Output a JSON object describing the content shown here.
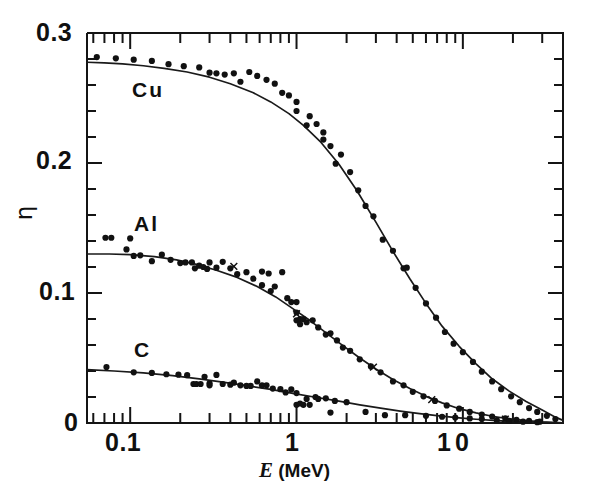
{
  "figure": {
    "axis_title_x_symbol": "E",
    "axis_title_x_units": " (MeV)",
    "axis_title_y": "η"
  },
  "labels": {
    "cu": "Cu",
    "al": "Al",
    "c": "C",
    "y_0_3": "0.3",
    "y_0_2": "0.2",
    "y_0_1": "0.1",
    "y_0": "0",
    "x_0_1": "0.1",
    "x_1": "1",
    "x_10": "10"
  },
  "chart_data": {
    "type": "scatter",
    "title": "",
    "xlabel": "E (MeV)",
    "ylabel": "η",
    "xscale": "log",
    "yscale": "linear",
    "xlim": [
      0.055,
      40
    ],
    "ylim": [
      0,
      0.3
    ],
    "xticks": [
      0.1,
      1,
      10
    ],
    "xtick_labels": [
      "0.1",
      "1",
      "10"
    ],
    "yticks": [
      0,
      0.1,
      0.2,
      0.3
    ],
    "ytick_labels": [
      "0",
      "0.1",
      "0.2",
      "0.3"
    ],
    "minor_ticks": true,
    "grid": false,
    "legend": "inline-labels",
    "series": [
      {
        "name": "Cu",
        "label_pos": {
          "x": 0.16,
          "y": 0.253
        },
        "marker": "filled-circle",
        "curve": [
          [
            0.055,
            0.2775
          ],
          [
            0.07,
            0.277
          ],
          [
            0.09,
            0.2762
          ],
          [
            0.12,
            0.2748
          ],
          [
            0.16,
            0.2728
          ],
          [
            0.22,
            0.27
          ],
          [
            0.3,
            0.266
          ],
          [
            0.4,
            0.261
          ],
          [
            0.55,
            0.254
          ],
          [
            0.7,
            0.247
          ],
          [
            0.9,
            0.238
          ],
          [
            1.1,
            0.229
          ],
          [
            1.4,
            0.216
          ],
          [
            1.8,
            0.199
          ],
          [
            2.3,
            0.179
          ],
          [
            3.0,
            0.1545
          ],
          [
            3.8,
            0.132
          ],
          [
            4.8,
            0.111
          ],
          [
            6.0,
            0.092
          ],
          [
            7.5,
            0.0745
          ],
          [
            9.5,
            0.059
          ],
          [
            12,
            0.0455
          ],
          [
            15,
            0.034
          ],
          [
            19,
            0.0245
          ],
          [
            24,
            0.0165
          ],
          [
            30,
            0.01
          ],
          [
            36,
            0.0045
          ],
          [
            40,
            0.002
          ]
        ],
        "points": [
          [
            0.063,
            0.2815
          ],
          [
            0.082,
            0.2805
          ],
          [
            0.105,
            0.2795
          ],
          [
            0.135,
            0.2785
          ],
          [
            0.17,
            0.276
          ],
          [
            0.21,
            0.2745
          ],
          [
            0.26,
            0.2735
          ],
          [
            0.3,
            0.2695
          ],
          [
            0.33,
            0.269
          ],
          [
            0.37,
            0.268
          ],
          [
            0.42,
            0.269
          ],
          [
            0.46,
            0.2625
          ],
          [
            0.52,
            0.27
          ],
          [
            0.58,
            0.267
          ],
          [
            0.66,
            0.264
          ],
          [
            0.74,
            0.261
          ],
          [
            0.82,
            0.254
          ],
          [
            0.9,
            0.252
          ],
          [
            1.0,
            0.247
          ],
          [
            1.0,
            0.24
          ],
          [
            1.15,
            0.229
          ],
          [
            1.2,
            0.236
          ],
          [
            1.32,
            0.23
          ],
          [
            1.45,
            0.2235
          ],
          [
            1.45,
            0.218
          ],
          [
            1.6,
            0.213
          ],
          [
            1.72,
            0.1995
          ],
          [
            1.85,
            0.2065
          ],
          [
            2.1,
            0.193
          ],
          [
            2.35,
            0.179
          ],
          [
            2.6,
            0.167
          ],
          [
            2.9,
            0.159
          ],
          [
            3.3,
            0.141
          ],
          [
            3.8,
            0.1325
          ],
          [
            4.4,
            0.119
          ],
          [
            4.6,
            0.1195
          ],
          [
            5.2,
            0.104
          ],
          [
            6.0,
            0.092
          ],
          [
            6.9,
            0.081
          ],
          [
            7.8,
            0.07
          ],
          [
            8.8,
            0.061
          ],
          [
            10,
            0.0545
          ],
          [
            11.5,
            0.047
          ],
          [
            13,
            0.0395
          ],
          [
            15,
            0.032
          ],
          [
            17,
            0.026
          ],
          [
            19.5,
            0.0205
          ],
          [
            22,
            0.016
          ],
          [
            25,
            0.0115
          ],
          [
            28,
            0.0085
          ],
          [
            32,
            0.0055
          ],
          [
            36,
            0.003
          ]
        ]
      },
      {
        "name": "Al",
        "label_pos": {
          "x": 0.165,
          "y": 0.158
        },
        "marker": "filled-circle",
        "extra_marker": "cross",
        "curve": [
          [
            0.055,
            0.13
          ],
          [
            0.075,
            0.13
          ],
          [
            0.1,
            0.1295
          ],
          [
            0.14,
            0.128
          ],
          [
            0.19,
            0.1255
          ],
          [
            0.25,
            0.122
          ],
          [
            0.33,
            0.1175
          ],
          [
            0.44,
            0.112
          ],
          [
            0.58,
            0.105
          ],
          [
            0.75,
            0.097
          ],
          [
            0.95,
            0.088
          ],
          [
            1.2,
            0.079
          ],
          [
            1.5,
            0.0695
          ],
          [
            1.9,
            0.0595
          ],
          [
            2.4,
            0.05
          ],
          [
            3.0,
            0.0415
          ],
          [
            3.8,
            0.0335
          ],
          [
            4.8,
            0.0265
          ],
          [
            6.0,
            0.0205
          ],
          [
            7.5,
            0.0155
          ],
          [
            9.5,
            0.011
          ],
          [
            12,
            0.0078
          ],
          [
            15,
            0.0052
          ],
          [
            19,
            0.0032
          ],
          [
            24,
            0.0018
          ],
          [
            30,
            0.0009
          ],
          [
            36,
            0.0004
          ],
          [
            40,
            0.0002
          ]
        ],
        "points": [
          [
            0.071,
            0.1425
          ],
          [
            0.077,
            0.1425
          ],
          [
            0.1,
            0.142
          ],
          [
            0.095,
            0.1335
          ],
          [
            0.105,
            0.1285
          ],
          [
            0.115,
            0.129
          ],
          [
            0.135,
            0.1245
          ],
          [
            0.155,
            0.1295
          ],
          [
            0.175,
            0.1255
          ],
          [
            0.2,
            0.123
          ],
          [
            0.215,
            0.1235
          ],
          [
            0.235,
            0.1235
          ],
          [
            0.245,
            0.119
          ],
          [
            0.26,
            0.121
          ],
          [
            0.275,
            0.12
          ],
          [
            0.29,
            0.1185
          ],
          [
            0.3,
            0.1235
          ],
          [
            0.33,
            0.1195
          ],
          [
            0.36,
            0.124
          ],
          [
            0.4,
            0.119
          ],
          [
            0.44,
            0.1145
          ],
          [
            0.5,
            0.116
          ],
          [
            0.55,
            0.111
          ],
          [
            0.62,
            0.1165
          ],
          [
            0.62,
            0.106
          ],
          [
            0.68,
            0.115
          ],
          [
            0.7,
            0.1015
          ],
          [
            0.74,
            0.105
          ],
          [
            0.82,
            0.116
          ],
          [
            0.88,
            0.096
          ],
          [
            0.93,
            0.093
          ],
          [
            1.0,
            0.093
          ],
          [
            1.0,
            0.085
          ],
          [
            1.0,
            0.079
          ],
          [
            1.05,
            0.08
          ],
          [
            1.05,
            0.076
          ],
          [
            1.1,
            0.08
          ],
          [
            1.15,
            0.0775
          ],
          [
            1.25,
            0.079
          ],
          [
            1.35,
            0.0735
          ],
          [
            1.5,
            0.068
          ],
          [
            1.6,
            0.069
          ],
          [
            1.75,
            0.0635
          ],
          [
            1.9,
            0.058
          ],
          [
            2.1,
            0.0555
          ],
          [
            2.4,
            0.049
          ],
          [
            2.8,
            0.0435
          ],
          [
            3.2,
            0.039
          ],
          [
            3.8,
            0.032
          ],
          [
            4.4,
            0.029
          ],
          [
            5.0,
            0.024
          ],
          [
            5.8,
            0.0205
          ],
          [
            6.8,
            0.017
          ],
          [
            8.0,
            0.0135
          ],
          [
            9.5,
            0.011
          ],
          [
            11,
            0.0085
          ],
          [
            13,
            0.0065
          ],
          [
            15,
            0.005
          ],
          [
            18,
            0.0035
          ],
          [
            21,
            0.0025
          ],
          [
            25,
            0.0016
          ],
          [
            29,
            0.001
          ]
        ],
        "cross_points": [
          [
            0.42,
            0.1205
          ],
          [
            1.0,
            0.084
          ],
          [
            2.9,
            0.043
          ],
          [
            6.5,
            0.018
          ],
          [
            18,
            0.003
          ]
        ]
      },
      {
        "name": "C",
        "label_pos": {
          "x": 0.165,
          "y": 0.05
        },
        "marker": "filled-circle",
        "curve": [
          [
            0.055,
            0.041
          ],
          [
            0.08,
            0.04
          ],
          [
            0.12,
            0.0385
          ],
          [
            0.18,
            0.0365
          ],
          [
            0.26,
            0.034
          ],
          [
            0.36,
            0.0315
          ],
          [
            0.5,
            0.0288
          ],
          [
            0.7,
            0.0258
          ],
          [
            0.95,
            0.0228
          ],
          [
            1.3,
            0.0198
          ],
          [
            1.8,
            0.0168
          ],
          [
            2.4,
            0.014
          ],
          [
            3.2,
            0.0115
          ],
          [
            4.2,
            0.0092
          ],
          [
            5.5,
            0.0072
          ],
          [
            7.2,
            0.0055
          ],
          [
            9.5,
            0.004
          ],
          [
            12,
            0.0029
          ],
          [
            16,
            0.0019
          ],
          [
            20,
            0.0012
          ],
          [
            26,
            0.0007
          ],
          [
            32,
            0.0004
          ],
          [
            40,
            0.0002
          ]
        ],
        "points": [
          [
            0.072,
            0.043
          ],
          [
            0.105,
            0.039
          ],
          [
            0.135,
            0.0385
          ],
          [
            0.165,
            0.0375
          ],
          [
            0.195,
            0.0372
          ],
          [
            0.22,
            0.0368
          ],
          [
            0.24,
            0.03
          ],
          [
            0.25,
            0.03
          ],
          [
            0.265,
            0.03
          ],
          [
            0.28,
            0.0355
          ],
          [
            0.3,
            0.0305
          ],
          [
            0.3,
            0.029
          ],
          [
            0.33,
            0.037
          ],
          [
            0.36,
            0.03
          ],
          [
            0.4,
            0.0295
          ],
          [
            0.42,
            0.031
          ],
          [
            0.46,
            0.029
          ],
          [
            0.5,
            0.0285
          ],
          [
            0.53,
            0.0285
          ],
          [
            0.58,
            0.032
          ],
          [
            0.62,
            0.029
          ],
          [
            0.66,
            0.029
          ],
          [
            0.72,
            0.0265
          ],
          [
            0.8,
            0.026
          ],
          [
            0.86,
            0.0235
          ],
          [
            0.93,
            0.0258
          ],
          [
            1.0,
            0.023
          ],
          [
            1.0,
            0.014
          ],
          [
            1.05,
            0.015
          ],
          [
            1.1,
            0.014
          ],
          [
            1.15,
            0.0185
          ],
          [
            1.2,
            0.014
          ],
          [
            1.3,
            0.02
          ],
          [
            1.35,
            0.0185
          ],
          [
            1.5,
            0.019
          ],
          [
            1.6,
            0.008
          ],
          [
            1.7,
            0.017
          ],
          [
            2.0,
            0.016
          ],
          [
            2.6,
            0.0085
          ],
          [
            3.4,
            0.006
          ],
          [
            4.5,
            0.006
          ],
          [
            6.0,
            0.0055
          ],
          [
            7.5,
            0.0048
          ],
          [
            9.0,
            0.0042
          ],
          [
            11,
            0.0035
          ],
          [
            13,
            0.003
          ],
          [
            16,
            0.0022
          ],
          [
            19,
            0.0016
          ],
          [
            23,
            0.001
          ],
          [
            28,
            0.0006
          ]
        ]
      }
    ]
  }
}
